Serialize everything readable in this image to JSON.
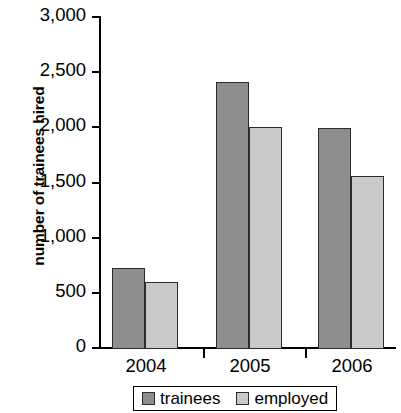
{
  "chart_data": {
    "type": "bar",
    "title": "",
    "xlabel": "",
    "ylabel": "number of trainees hired",
    "categories": [
      "2004",
      "2005",
      "2006"
    ],
    "series": [
      {
        "name": "trainees",
        "color": "#8e8e8e",
        "values": [
          730,
          2420,
          2000
        ]
      },
      {
        "name": "employed",
        "color": "#c9c9c9",
        "values": [
          610,
          2010,
          1570
        ]
      }
    ],
    "ylim": [
      0,
      3000
    ],
    "ytick_values": [
      0,
      500,
      1000,
      1500,
      2000,
      2500,
      3000
    ],
    "ytick_labels": [
      "0",
      "500",
      "1,000",
      "1,500",
      "2,000",
      "2,500",
      "3,000"
    ],
    "grid": false,
    "legend_position": "bottom"
  },
  "axis": {
    "y_title": "number of trainees hired",
    "ticks": {
      "t3000": "3,000",
      "t2500": "2,500",
      "t2000": "2,000",
      "t1500": "1,500",
      "t1000": "1,000",
      "t500": "500",
      "t0": "0"
    }
  },
  "categories": {
    "c0": "2004",
    "c1": "2005",
    "c2": "2006"
  },
  "legend": {
    "trainees_label": "trainees",
    "employed_label": "employed"
  }
}
